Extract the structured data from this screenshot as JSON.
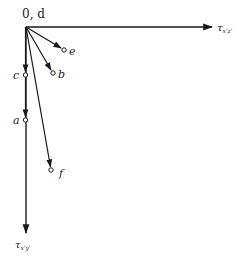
{
  "diagram": {
    "type": "vector-diagram",
    "colors": {
      "stroke": "#1a1a1a",
      "text": "#222222",
      "background": "#ffffff"
    },
    "origin": {
      "label": "0, d",
      "x": 26,
      "y": 27
    },
    "axes": {
      "horizontal": {
        "label_main": "τ",
        "label_sub": "x'z'",
        "end": {
          "x": 213,
          "y": 27
        }
      },
      "vertical": {
        "label_main": "τ",
        "label_sub": "x'y'",
        "end": {
          "x": 26,
          "y": 234
        }
      }
    },
    "points": [
      {
        "id": "e",
        "label": "e",
        "x": 64,
        "y": 50
      },
      {
        "id": "b",
        "label": "b",
        "x": 53,
        "y": 73
      },
      {
        "id": "c",
        "label": "c",
        "x": 25,
        "y": 75
      },
      {
        "id": "a",
        "label": "a",
        "x": 25,
        "y": 120
      },
      {
        "id": "f",
        "label": "f",
        "x": 51,
        "y": 170
      }
    ]
  }
}
